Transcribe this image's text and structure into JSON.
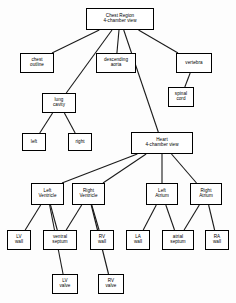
{
  "diagram": {
    "style": {
      "box_fill": "#ffffff",
      "box_stroke": "#000000",
      "edge_color": "#1a1a1a",
      "background": "#fdfdfd"
    },
    "nodes": [
      {
        "id": "chest_region",
        "lines": [
          "Chest Region",
          "4-chamber view"
        ],
        "x": 86,
        "y": 8,
        "w": 68,
        "h": 22
      },
      {
        "id": "chest_outline",
        "lines": [
          "chest",
          "outline"
        ],
        "x": 20,
        "y": 53,
        "w": 34,
        "h": 20
      },
      {
        "id": "descending_aorta",
        "lines": [
          "descending",
          "aorta"
        ],
        "x": 96,
        "y": 53,
        "w": 40,
        "h": 20
      },
      {
        "id": "vertebra",
        "lines": [
          "vertebra"
        ],
        "x": 176,
        "y": 53,
        "w": 36,
        "h": 20
      },
      {
        "id": "spinal_cord",
        "lines": [
          "spinal",
          "cord"
        ],
        "x": 168,
        "y": 87,
        "w": 26,
        "h": 20
      },
      {
        "id": "lung_cavity",
        "lines": [
          "lung",
          "cavity"
        ],
        "x": 42,
        "y": 93,
        "w": 34,
        "h": 20
      },
      {
        "id": "left_lung",
        "lines": [
          "left"
        ],
        "x": 22,
        "y": 133,
        "w": 24,
        "h": 18
      },
      {
        "id": "right_lung",
        "lines": [
          "right"
        ],
        "x": 68,
        "y": 133,
        "w": 24,
        "h": 18
      },
      {
        "id": "heart",
        "lines": [
          "Heart",
          "4-chamber view"
        ],
        "x": 131,
        "y": 132,
        "w": 62,
        "h": 22
      },
      {
        "id": "left_ventricle",
        "lines": [
          "Left",
          "Ventricle"
        ],
        "x": 31,
        "y": 183,
        "w": 33,
        "h": 22
      },
      {
        "id": "right_ventricle",
        "lines": [
          "Right",
          "Ventricle"
        ],
        "x": 72,
        "y": 183,
        "w": 33,
        "h": 22
      },
      {
        "id": "left_atrium",
        "lines": [
          "Left",
          "Atrium"
        ],
        "x": 146,
        "y": 183,
        "w": 32,
        "h": 22
      },
      {
        "id": "right_atrium",
        "lines": [
          "Right",
          "Atrium"
        ],
        "x": 190,
        "y": 183,
        "w": 32,
        "h": 22
      },
      {
        "id": "lv_wall",
        "lines": [
          "LV",
          "wall"
        ],
        "x": 7,
        "y": 230,
        "w": 24,
        "h": 20
      },
      {
        "id": "ventral_septum",
        "lines": [
          "ventral",
          "septum"
        ],
        "x": 43,
        "y": 230,
        "w": 34,
        "h": 20
      },
      {
        "id": "rv_wall",
        "lines": [
          "RV",
          "wall"
        ],
        "x": 90,
        "y": 230,
        "w": 24,
        "h": 20
      },
      {
        "id": "la_wall",
        "lines": [
          "LA",
          "wall"
        ],
        "x": 126,
        "y": 230,
        "w": 24,
        "h": 20
      },
      {
        "id": "atrial_septum",
        "lines": [
          "atrial",
          "septum"
        ],
        "x": 162,
        "y": 230,
        "w": 32,
        "h": 20
      },
      {
        "id": "ra_wall",
        "lines": [
          "RA",
          "wall"
        ],
        "x": 205,
        "y": 230,
        "w": 24,
        "h": 20
      },
      {
        "id": "lv_valve",
        "lines": [
          "LV",
          "valve"
        ],
        "x": 52,
        "y": 274,
        "w": 26,
        "h": 20
      },
      {
        "id": "rv_valve",
        "lines": [
          "RV",
          "valve"
        ],
        "x": 98,
        "y": 274,
        "w": 26,
        "h": 20
      }
    ],
    "edges": [
      {
        "from": "chest_region",
        "to": "chest_outline"
      },
      {
        "from": "chest_region",
        "to": "lung_cavity"
      },
      {
        "from": "chest_region",
        "to": "descending_aorta"
      },
      {
        "from": "chest_region",
        "to": "heart"
      },
      {
        "from": "chest_region",
        "to": "vertebra"
      },
      {
        "from": "vertebra",
        "to": "spinal_cord"
      },
      {
        "from": "lung_cavity",
        "to": "left_lung"
      },
      {
        "from": "lung_cavity",
        "to": "right_lung"
      },
      {
        "from": "heart",
        "to": "left_ventricle"
      },
      {
        "from": "heart",
        "to": "right_ventricle"
      },
      {
        "from": "heart",
        "to": "left_atrium"
      },
      {
        "from": "heart",
        "to": "right_atrium"
      },
      {
        "from": "left_ventricle",
        "to": "lv_wall"
      },
      {
        "from": "left_ventricle",
        "to": "lv_valve"
      },
      {
        "from": "left_ventricle",
        "to": "ventral_septum"
      },
      {
        "from": "right_ventricle",
        "to": "ventral_septum"
      },
      {
        "from": "right_ventricle",
        "to": "rv_valve"
      },
      {
        "from": "right_ventricle",
        "to": "rv_wall"
      },
      {
        "from": "left_atrium",
        "to": "la_wall"
      },
      {
        "from": "left_atrium",
        "to": "atrial_septum"
      },
      {
        "from": "right_atrium",
        "to": "atrial_septum"
      },
      {
        "from": "right_atrium",
        "to": "ra_wall"
      }
    ]
  }
}
